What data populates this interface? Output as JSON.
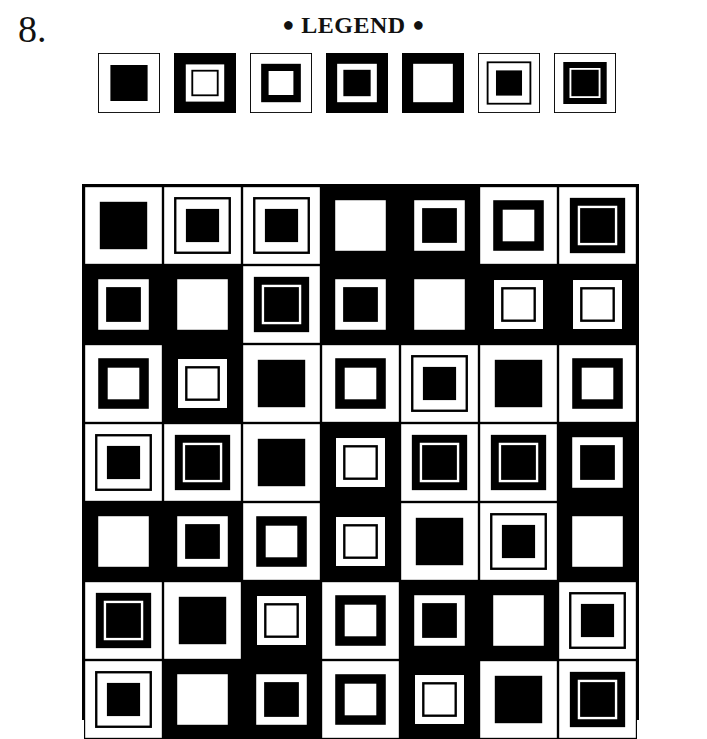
{
  "header": {
    "number": "8.",
    "legend_title": "LEGEND",
    "bullet": "●"
  },
  "colors": {
    "black": "#000000",
    "white": "#ffffff"
  },
  "legend": {
    "types": [
      {
        "id": "A",
        "description": "white outer, black inner square"
      },
      {
        "id": "B",
        "description": "black outer, white ring, thin black line, white center"
      },
      {
        "id": "C",
        "description": "white outer, thick black ring, white center"
      },
      {
        "id": "D",
        "description": "black outer, white ring, black center"
      },
      {
        "id": "E",
        "description": "black outer, white center"
      },
      {
        "id": "F",
        "description": "white outer, thin black line, white ring, black center"
      },
      {
        "id": "G",
        "description": "white outer, black ring, thin white line, black center"
      }
    ]
  },
  "grid": {
    "rows": 7,
    "cols": 7,
    "cells": [
      [
        "A",
        "F",
        "F",
        "E",
        "D",
        "C",
        "G"
      ],
      [
        "D",
        "E",
        "G",
        "D",
        "E",
        "B",
        "B"
      ],
      [
        "C",
        "B",
        "A",
        "C",
        "F",
        "A",
        "C"
      ],
      [
        "F",
        "G",
        "A",
        "B",
        "G",
        "G",
        "D"
      ],
      [
        "E",
        "D",
        "C",
        "B",
        "A",
        "F",
        "E"
      ],
      [
        "G",
        "A",
        "B",
        "C",
        "D",
        "E",
        "F"
      ],
      [
        "F",
        "E",
        "D",
        "C",
        "B",
        "A",
        "G"
      ]
    ]
  }
}
